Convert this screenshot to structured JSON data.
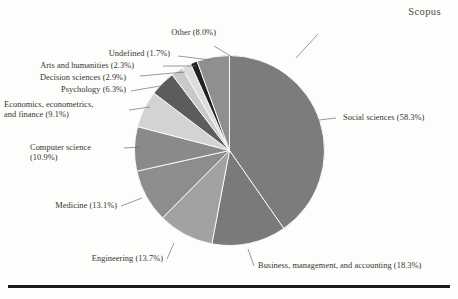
{
  "figure": {
    "title": "Scopus",
    "bottom_rule": true
  },
  "chart_data": {
    "type": "pie",
    "title": "Scopus",
    "xlabel": "",
    "ylabel": "",
    "legend_position": "none",
    "labels_style": "external-leader-lines",
    "categories": [
      "Social sciences",
      "Business, management, and accounting",
      "Engineering",
      "Medicine",
      "Computer science",
      "Economics, econometrics, and finance",
      "Psychology",
      "Decision sciences",
      "Arts and humanities",
      "Undefined",
      "Other"
    ],
    "values": [
      58.3,
      18.3,
      13.7,
      13.1,
      10.9,
      9.1,
      6.3,
      2.9,
      2.3,
      1.7,
      8.0
    ],
    "unit": "%",
    "slices": [
      {
        "name": "Social sciences",
        "value": 58.3,
        "label": "Social sciences (58.3%)",
        "color": "#7c7c7c"
      },
      {
        "name": "Business, management, and accounting",
        "value": 18.3,
        "label": "Business, management, and accounting (18.3%)",
        "color": "#7a7a7a"
      },
      {
        "name": "Engineering",
        "value": 13.7,
        "label": "Engineering (13.7%)",
        "color": "#a2a2a2"
      },
      {
        "name": "Medicine",
        "value": 13.1,
        "label": "Medicine (13.1%)",
        "color": "#8d8d8d"
      },
      {
        "name": "Computer science",
        "value": 10.9,
        "label": "Computer science (10.9%)",
        "color": "#8a8a8a"
      },
      {
        "name": "Economics, econometrics, and finance",
        "value": 9.1,
        "label": "Economics, econometrics, and finance (9.1%)",
        "color": "#d3d3d3"
      },
      {
        "name": "Psychology",
        "value": 6.3,
        "label": "Psychology (6.3%)",
        "color": "#5c5c5c"
      },
      {
        "name": "Decision sciences",
        "value": 2.9,
        "label": "Decision sciences (2.9%)",
        "color": "#c9c9c9"
      },
      {
        "name": "Arts and humanities",
        "value": 2.3,
        "label": "Arts and humanities (2.3%)",
        "color": "#dcdcdc"
      },
      {
        "name": "Undefined",
        "value": 1.7,
        "label": "Undefined (1.7%)",
        "color": "#222222"
      },
      {
        "name": "Other",
        "value": 8.0,
        "label": "Other (8.0%)",
        "color": "#8f8f8f"
      }
    ]
  },
  "labels": {
    "social_sciences": "Social sciences (58.3%)",
    "business": "Business, management, and accounting (18.3%)",
    "engineering": "Engineering (13.7%)",
    "medicine": "Medicine (13.1%)",
    "computer_science_line1": "Computer science",
    "computer_science_line2": "(10.9%)",
    "economics_line1": "Economics, econometrics,",
    "economics_line2": "and finance (9.1%)",
    "psychology": "Psychology (6.3%)",
    "decision_sciences": "Decision sciences (2.9%)",
    "arts": "Arts and humanities (2.3%)",
    "undefined": "Undefined (1.7%)",
    "other": "Other (8.0%)"
  }
}
